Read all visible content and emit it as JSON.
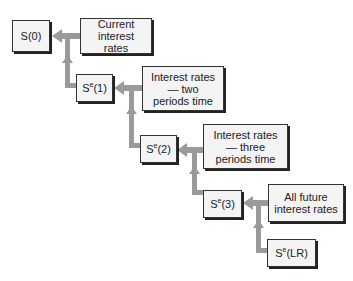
{
  "nodes": {
    "s0": {
      "label": "S(0)"
    },
    "se1": {
      "base": "S",
      "sup": "e",
      "arg": "(1)"
    },
    "se2": {
      "base": "S",
      "sup": "e",
      "arg": "(2)"
    },
    "se3": {
      "base": "S",
      "sup": "e",
      "arg": "(3)"
    },
    "selr": {
      "base": "S",
      "sup": "e",
      "arg": "(LR)"
    }
  },
  "factors": {
    "current": "Current interest rates",
    "two_periods": "Interest rates— two periods time",
    "three_periods": "Interest rates— three periods time",
    "all_future": "All future interest rates"
  },
  "colors": {
    "arrow": "#9a9a9a",
    "box_fill": "#f4f4f4",
    "border": "#333333"
  }
}
